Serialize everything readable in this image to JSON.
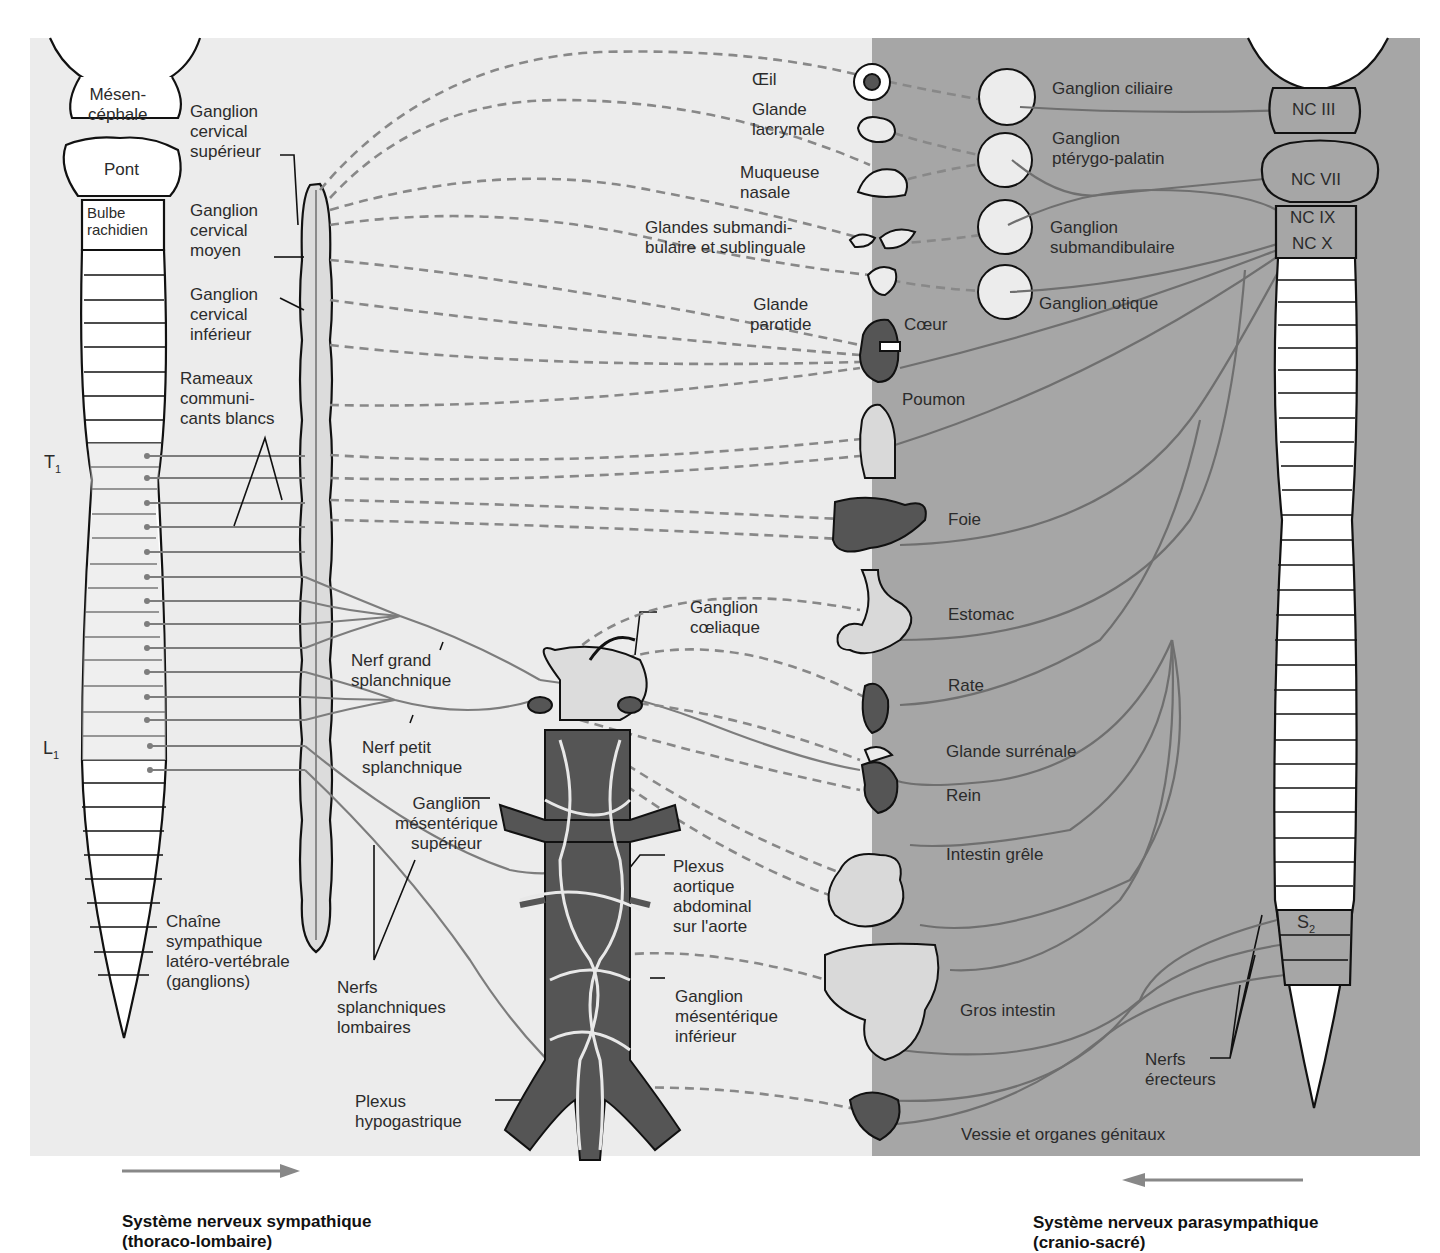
{
  "colors": {
    "sympathetic_bg": "#ececec",
    "parasympathetic_bg": "#a6a6a6",
    "nerve_line": "#7d7d7d",
    "outline": "#111111",
    "organ_dark": "#555555",
    "organ_light": "#d9d9d9"
  },
  "brainstem_left": {
    "mesencephale": "Mésen-\ncéphale",
    "pont": "Pont",
    "bulbe": "Bulbe\nrachidien"
  },
  "brainstem_right": {
    "nc3": "NC III",
    "nc7": "NC VII",
    "nc9": "NC IX",
    "nc10": "NC X"
  },
  "spinal_markers": {
    "t1": "T",
    "t1_sub": "1",
    "l1": "L",
    "l1_sub": "1",
    "s2": "S",
    "s2_sub": "2"
  },
  "sympathetic_labels": {
    "ganglion_cervical_superieur": "Ganglion\ncervical\nsupérieur",
    "ganglion_cervical_moyen": "Ganglion\ncervical\nmoyen",
    "ganglion_cervical_inferieur": "Ganglion\ncervical\ninférieur",
    "rameaux": "Rameaux\ncommuni-\ncants blancs",
    "nerf_grand_splanchnique": "Nerf grand\nsplanchnique",
    "nerf_petit_splanchnique": "Nerf petit\nsplanchnique",
    "chaine": "Chaîne\nsympathique\nlatéro-vertébrale\n(ganglions)",
    "nerfs_splanchniques_lombaires": "Nerfs\nsplanchniques\nlombaires",
    "ganglion_coeliaque": "Ganglion\ncœliaque",
    "ganglion_mesenterique_superieur": "Ganglion\nmésentérique\nsupérieur",
    "plexus_aortique": "Plexus\naortique\nabdominal\nsur l'aorte",
    "ganglion_mesenterique_inferieur": "Ganglion\nmésentérique\ninférieur",
    "plexus_hypogastrique": "Plexus\nhypogastrique"
  },
  "organs": [
    {
      "id": "oeil",
      "label": "Œil"
    },
    {
      "id": "glande_lacrymale",
      "label": "Glande\nlacrymale"
    },
    {
      "id": "muqueuse_nasale",
      "label": "Muqueuse\nnasale"
    },
    {
      "id": "glandes_submandibulaire",
      "label": "Glandes submandi-\nbulaire et sublinguale"
    },
    {
      "id": "glande_parotide",
      "label": "Glande\nparotide"
    },
    {
      "id": "coeur",
      "label": "Cœur"
    },
    {
      "id": "poumon",
      "label": "Poumon"
    },
    {
      "id": "foie",
      "label": "Foie"
    },
    {
      "id": "estomac",
      "label": "Estomac"
    },
    {
      "id": "rate",
      "label": "Rate"
    },
    {
      "id": "glande_surrenale",
      "label": "Glande surrénale"
    },
    {
      "id": "rein",
      "label": "Rein"
    },
    {
      "id": "intestin_grele",
      "label": "Intestin grêle"
    },
    {
      "id": "gros_intestin",
      "label": "Gros intestin"
    },
    {
      "id": "vessie",
      "label": "Vessie et organes génitaux"
    }
  ],
  "parasympathetic_ganglia": [
    {
      "id": "ciliaire",
      "label": "Ganglion ciliaire"
    },
    {
      "id": "pterygo",
      "label": "Ganglion\nptérygo-palatin"
    },
    {
      "id": "submandibulaire",
      "label": "Ganglion\nsubmandibulaire"
    },
    {
      "id": "otique",
      "label": "Ganglion otique"
    }
  ],
  "parasympathetic_labels": {
    "nerfs_erecteurs": "Nerfs\nérecteurs"
  },
  "captions": {
    "sympathetic": "Système nerveux sympathique\n(thoraco-lombaire)",
    "parasympathetic": "Système nerveux parasympathique\n(cranio-sacré)"
  }
}
